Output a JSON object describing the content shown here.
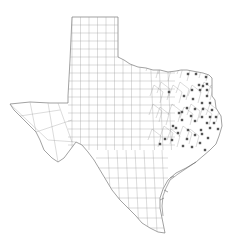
{
  "map": {
    "region": "Texas",
    "subdivision": "counties",
    "background_color": "#ffffff",
    "line_color": "#9a9a9a",
    "marker_color": "#555555",
    "marker_shape": "square-dot",
    "marker_count": 47,
    "markers": [
      [
        188,
        74
      ],
      [
        196,
        74
      ],
      [
        206,
        77
      ],
      [
        199,
        85
      ],
      [
        203,
        86
      ],
      [
        207,
        84
      ],
      [
        192,
        90
      ],
      [
        200,
        90
      ],
      [
        207,
        90
      ],
      [
        169,
        92
      ],
      [
        184,
        96
      ],
      [
        207,
        96
      ],
      [
        193,
        99
      ],
      [
        202,
        103
      ],
      [
        210,
        103
      ],
      [
        187,
        108
      ],
      [
        195,
        109
      ],
      [
        203,
        109
      ],
      [
        212,
        110
      ],
      [
        179,
        113
      ],
      [
        191,
        116
      ],
      [
        202,
        117
      ],
      [
        210,
        117
      ],
      [
        216,
        117
      ],
      [
        182,
        120
      ],
      [
        195,
        121
      ],
      [
        207,
        123
      ],
      [
        173,
        126
      ],
      [
        188,
        130
      ],
      [
        201,
        130
      ],
      [
        210,
        128
      ],
      [
        218,
        129
      ],
      [
        178,
        133
      ],
      [
        195,
        135
      ],
      [
        202,
        134
      ],
      [
        208,
        138
      ],
      [
        165,
        139
      ],
      [
        172,
        140
      ],
      [
        160,
        144
      ],
      [
        183,
        146
      ],
      [
        192,
        147
      ],
      [
        200,
        143
      ],
      [
        182,
        112
      ],
      [
        176,
        128
      ],
      [
        205,
        150
      ],
      [
        187,
        139
      ],
      [
        214,
        123
      ]
    ]
  }
}
